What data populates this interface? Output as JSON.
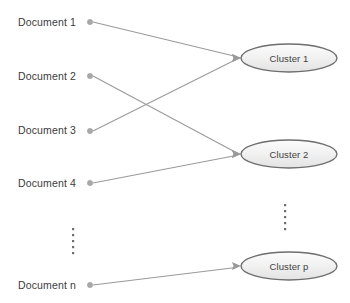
{
  "diagram": {
    "type": "bipartite-mapping",
    "background_color": "#ffffff",
    "edge_color": "#9a9a9a",
    "node_border_color": "#6d6d6d",
    "node_fill_top": "#fbfbfb",
    "node_fill_bottom": "#e6e6e6",
    "dot_color": "#a8a8a8",
    "text_color": "#3b3b3b"
  },
  "documents": [
    {
      "id": "doc-1",
      "label": "Document 1",
      "text_x": 18,
      "text_y": 26,
      "dot_x": 90,
      "dot_y": 22
    },
    {
      "id": "doc-2",
      "label": "Document 2",
      "text_x": 18,
      "text_y": 80,
      "dot_x": 90,
      "dot_y": 76
    },
    {
      "id": "doc-3",
      "label": "Document 3",
      "text_x": 18,
      "text_y": 134,
      "dot_x": 90,
      "dot_y": 131
    },
    {
      "id": "doc-4",
      "label": "Document 4",
      "text_x": 18,
      "text_y": 187,
      "dot_x": 90,
      "dot_y": 183
    },
    {
      "id": "doc-n",
      "label": "Document n",
      "text_x": 18,
      "text_y": 289,
      "dot_x": 90,
      "dot_y": 285
    }
  ],
  "clusters": [
    {
      "id": "cluster-1",
      "label": "Cluster 1",
      "cx": 289,
      "cy": 58,
      "rx": 48,
      "ry": 14
    },
    {
      "id": "cluster-2",
      "label": "Cluster 2",
      "cx": 289,
      "cy": 154,
      "rx": 48,
      "ry": 14
    },
    {
      "id": "cluster-p",
      "label": "Cluster p",
      "cx": 289,
      "cy": 266,
      "rx": 48,
      "ry": 14
    }
  ],
  "edges": [
    {
      "id": "edge-doc1-cluster1",
      "from": "Document 1",
      "to": "Cluster 1",
      "x1": 93,
      "y1": 22,
      "x2": 239,
      "y2": 57
    },
    {
      "id": "edge-doc2-cluster2",
      "from": "Document 2",
      "to": "Cluster 2",
      "x1": 93,
      "y1": 76,
      "x2": 239,
      "y2": 153
    },
    {
      "id": "edge-doc3-cluster1",
      "from": "Document 3",
      "to": "Cluster 1",
      "x1": 93,
      "y1": 131,
      "x2": 239,
      "y2": 59
    },
    {
      "id": "edge-doc4-cluster2",
      "from": "Document 4",
      "to": "Cluster 2",
      "x1": 93,
      "y1": 183,
      "x2": 239,
      "y2": 155
    },
    {
      "id": "edge-docn-clusterp",
      "from": "Document n",
      "to": "Cluster p",
      "x1": 93,
      "y1": 285,
      "x2": 239,
      "y2": 267
    }
  ],
  "ellipses_marks": [
    {
      "id": "documents-ellipsis",
      "symbol": "vertical-dots",
      "x": 73,
      "y_start": 229,
      "count": 5,
      "spacing": 6
    },
    {
      "id": "clusters-ellipsis",
      "symbol": "vertical-dots",
      "x": 285,
      "y_start": 205,
      "count": 5,
      "spacing": 6
    }
  ]
}
